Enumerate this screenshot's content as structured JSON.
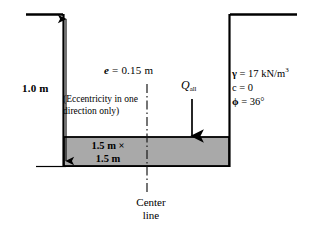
{
  "figure": {
    "type": "engineering-cross-section",
    "depth_label": "1.0 m",
    "eccentricity": {
      "symbol": "e",
      "equals": "=",
      "value": "0.15 m",
      "full": "e = 0.15 m"
    },
    "load": {
      "symbol": "Q",
      "subscript": "all",
      "full": "Qall"
    },
    "note": "(Eccentricity in one direction only)",
    "footing": {
      "width": "1.5 m",
      "times": "×",
      "length": "1.5 m",
      "line1": "1.5 m ×",
      "line2": "1.5 m",
      "fill_color": "#a9a9a9",
      "edge_color": "#000000"
    },
    "centerline": {
      "line1": "Center",
      "line2": "line"
    },
    "soil_properties": [
      {
        "symbol": "γ",
        "equals": "=",
        "value": "17 kN/m",
        "exponent": "3"
      },
      {
        "symbol": "c",
        "equals": "=",
        "value": "0",
        "exponent": ""
      },
      {
        "symbol": "ϕ",
        "equals": "=",
        "value": "36°",
        "exponent": ""
      }
    ],
    "colors": {
      "soil_stipple": "#4a4a4a",
      "ground_line": "#000000",
      "footing_gray": "#a9a9a9"
    }
  }
}
